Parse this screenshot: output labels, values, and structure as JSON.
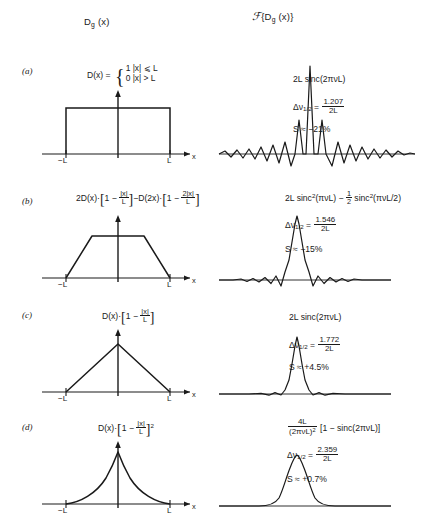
{
  "headers": {
    "left": "Dg (x)",
    "left_main": "D",
    "left_sub": "g",
    "left_arg": " (x)",
    "right_script": "ℱ",
    "right_open": "{D",
    "right_sub": "g",
    "right_close": " (x)}"
  },
  "axis": {
    "neg_L": "−L",
    "pos_L": "L",
    "x_label": "x"
  },
  "rows": [
    {
      "id": "a",
      "label": "(a)",
      "formula_lead": "D(x) = ",
      "case_1": "1   |x| ⩽ L",
      "case_2": "0   |x| > L",
      "transform": "2L sinc(2πνL)",
      "resolution_lead": "Δν",
      "resolution_sub": "1/2",
      "resolution_eq": " = ",
      "resolution_num": "1.207",
      "resolution_den": "2L",
      "sidelobe": "S ≈ −21%",
      "shape": "rect"
    },
    {
      "id": "b",
      "label": "(b)",
      "formula_parts": "2D(x)·[1 − |x|/L] − D(2x)·[1 − 2|x|/L]",
      "f_p1": "2D(x)·",
      "f_p2": "1 − ",
      "f_p2_num": "|x|",
      "f_p2_den": "L",
      "f_p3": "−D(2x)·",
      "f_p4": "1 − ",
      "f_p4_num": "2|x|",
      "f_p4_den": "L",
      "transform": "2L sinc²(πνL) −  ½  sinc²(πνL/2)",
      "t_p1": "2L sinc",
      "t_sup": "2",
      "t_p2": "(πνL) − ",
      "t_half_num": "1",
      "t_half_den": "2",
      "t_p3": " sinc",
      "t_sup2": "2",
      "t_p4": "(πνL/2)",
      "resolution_lead": "Δν",
      "resolution_sub": "1/2",
      "resolution_eq": " = ",
      "resolution_num": "1.546",
      "resolution_den": "2L",
      "sidelobe": "S ≈ −15%",
      "shape": "trapezoid"
    },
    {
      "id": "c",
      "label": "(c)",
      "f_p1": "D(x)·",
      "f_p2": "1 − ",
      "f_p2_num": "|x|",
      "f_p2_den": "L",
      "transform": "2L sinc(2πνL)",
      "resolution_lead": "Δν",
      "resolution_sub": "1/2",
      "resolution_eq": " = ",
      "resolution_num": "1.772",
      "resolution_den": "2L",
      "sidelobe": "S ≈ +4.5%",
      "shape": "triangle"
    },
    {
      "id": "d",
      "label": "(d)",
      "f_p1": "D(x)·",
      "f_p2": "1 − ",
      "f_p2_num": "|x|",
      "f_p2_den": "L",
      "f_sup": "2",
      "t_frac_num": "4L",
      "t_frac_den": "(2πνL)",
      "t_den_sup": "2",
      "t_rest": " [1 − sinc(2πνL)]",
      "resolution_lead": "Δν",
      "resolution_sub": "1/2",
      "resolution_eq": " = ",
      "resolution_num": "2.359",
      "resolution_den": "2L",
      "sidelobe": "S ≈ +0.7%",
      "shape": "triangle-squared"
    }
  ],
  "colors": {
    "ink": "#1a1a1a",
    "background": "#ffffff"
  }
}
